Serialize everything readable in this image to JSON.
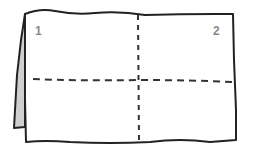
{
  "diagram": {
    "panels": [
      {
        "id": "panel-1",
        "label": "1"
      },
      {
        "id": "panel-2",
        "label": "2"
      }
    ],
    "colors": {
      "outline": "#222222",
      "fold_line": "#333333",
      "flap_fill": "#cfcfcf",
      "label": "#8a8a8a",
      "background": "#ffffff"
    }
  }
}
